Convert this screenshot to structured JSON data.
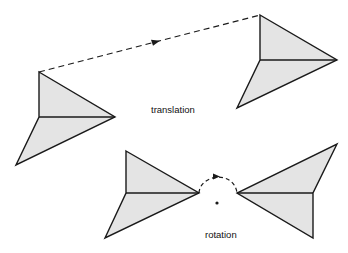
{
  "labels": {
    "translation": "translation",
    "rotation": "rotation"
  },
  "colors": {
    "fill": "#e4e4e4",
    "stroke": "#1a1a1a",
    "background": "#ffffff"
  },
  "figures": {
    "translation": {
      "original": {
        "top": [
          39,
          72
        ],
        "middle": [
          39,
          117
        ],
        "tip": [
          115,
          117
        ],
        "tail": [
          16,
          165
        ]
      },
      "translated": {
        "top": [
          260,
          15
        ],
        "middle": [
          260,
          60
        ],
        "tip": [
          337,
          60
        ],
        "tail": [
          237,
          108
        ]
      },
      "path": {
        "from": [
          39,
          72
        ],
        "to": [
          260,
          15
        ],
        "style": "dashed",
        "arrow_at": [
          155,
          42
        ]
      }
    },
    "rotation": {
      "original": {
        "top": [
          126,
          151
        ],
        "middle": [
          126,
          193
        ],
        "tip": [
          199,
          193
        ],
        "tail": [
          105,
          238
        ]
      },
      "rotated": {
        "top": [
          313,
          193
        ],
        "middle": [
          313,
          193
        ],
        "tip": [
          237,
          193
        ],
        "tail": [
          337,
          144
        ],
        "bottom": [
          313,
          238
        ]
      },
      "center": [
        217,
        202
      ],
      "arc": {
        "from": [
          199,
          193
        ],
        "to": [
          237,
          193
        ],
        "style": "dashed",
        "direction": "clockwise"
      }
    }
  }
}
